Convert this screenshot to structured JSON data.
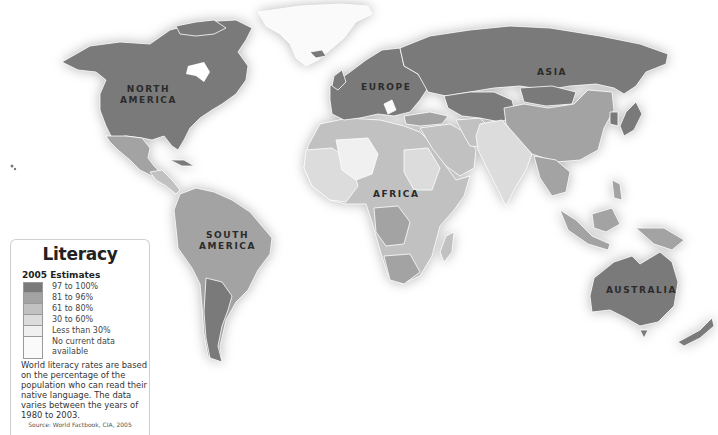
{
  "map": {
    "title": "Literacy",
    "subtitle": "2005 Estimates",
    "continent_labels": [
      {
        "id": "north-america",
        "line1": "NORTH",
        "line2": "AMERICA"
      },
      {
        "id": "south-america",
        "line1": "SOUTH",
        "line2": "AMERICA"
      },
      {
        "id": "europe",
        "line1": "EUROPE",
        "line2": ""
      },
      {
        "id": "asia",
        "line1": "ASIA",
        "line2": ""
      },
      {
        "id": "africa",
        "line1": "AFRICA",
        "line2": ""
      },
      {
        "id": "australia",
        "line1": "AUSTRALIA",
        "line2": ""
      }
    ]
  },
  "legend": {
    "title": "Literacy",
    "subtitle": "2005 Estimates",
    "items": [
      {
        "label": "97 to 100%",
        "color": "#7a7a7a"
      },
      {
        "label": "81 to 96%",
        "color": "#a3a3a3"
      },
      {
        "label": "61 to 80%",
        "color": "#c1c1c1"
      },
      {
        "label": "30 to 60%",
        "color": "#dcdcdc"
      },
      {
        "label": "Less than 30%",
        "color": "#f0f0f0"
      },
      {
        "label": "No current data available",
        "color": "#fafafa"
      }
    ],
    "note": "World literacy rates are based on the percentage of the population who can read their native language. The data varies between the years of 1980 to 2003.",
    "source": "Source: World Factbook, CIA, 2005"
  },
  "colors": {
    "tier1": "#7a7a7a",
    "tier2": "#a3a3a3",
    "tier3": "#c1c1c1",
    "tier4": "#dcdcdc",
    "tier5": "#f0f0f0",
    "nodata": "#fafafa",
    "background": "#ffffff"
  }
}
